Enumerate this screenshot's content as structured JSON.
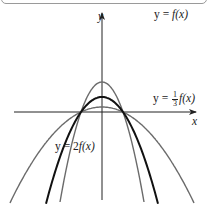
{
  "figure": {
    "type": "function-graph",
    "axes": {
      "x_label": "x",
      "y_label": "y",
      "origin_px": [
        102,
        112
      ],
      "unit_px": 21
    },
    "curves": [
      {
        "id": "f",
        "label_prefix": "y = ",
        "label_func": "f(x)",
        "expression": "f(x) = 0.72(x^2 - 1)",
        "scale": 1,
        "stroke": "#111111",
        "stroke_width": 2.0,
        "vertex_y_px": 127
      },
      {
        "id": "one_third_f",
        "label_prefix": "y = ",
        "label_frac_num": "1",
        "label_frac_den": "3",
        "label_func": "f(x)",
        "expression": "y = (1/3) f(x)",
        "scale": 0.3333,
        "stroke": "#6b6b6b",
        "stroke_width": 1.4,
        "vertex_y_px": 117
      },
      {
        "id": "two_f",
        "label_prefix": "y = ",
        "label_coef": "2",
        "label_func": "f(x)",
        "expression": "y = 2 f(x)",
        "scale": 2,
        "stroke": "#6b6b6b",
        "stroke_width": 1.4,
        "vertex_y_px": 142
      }
    ],
    "shared_roots_x": [
      -1,
      1
    ],
    "labels": {
      "f": "y = f(x)",
      "one_third_f": "y = 1/3 f(x)",
      "two_f": "y = 2f(x)",
      "x_axis": "x",
      "y_axis": "y"
    },
    "colors": {
      "axis": "#222222",
      "background": "#ffffff",
      "frame": "#9a9a9a"
    }
  }
}
